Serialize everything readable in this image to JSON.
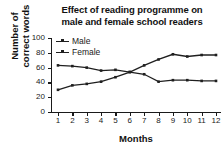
{
  "chart_data": {
    "type": "line",
    "title": "Effect of reading programme on male and female school readers",
    "title_lines": [
      "Effect of reading programme on",
      "male and female school readers"
    ],
    "xlabel": "Months",
    "ylabel": "Number of correct words",
    "ylabel_lines": [
      "Number of",
      "correct words"
    ],
    "x": [
      1,
      2,
      3,
      4,
      5,
      6,
      7,
      8,
      9,
      10,
      11,
      12
    ],
    "xtick_labels": [
      "1",
      "2",
      "3",
      "4",
      "5",
      "6",
      "7",
      "8",
      "9",
      "10",
      "11",
      "12"
    ],
    "ytick_labels": [
      "0",
      "20",
      "40",
      "60",
      "80",
      "100"
    ],
    "yticks": [
      0,
      20,
      40,
      60,
      80,
      100
    ],
    "ylim": [
      0,
      100
    ],
    "xlim": [
      1,
      12
    ],
    "grid": false,
    "legend_position": "top-left",
    "series": [
      {
        "name": "Male",
        "color": "#1f1f1f",
        "marker": "square",
        "values": [
          30,
          36,
          38,
          41,
          47,
          54,
          63,
          71,
          78,
          75,
          77,
          77
        ]
      },
      {
        "name": "Female",
        "color": "#1f1f1f",
        "marker": "square",
        "values": [
          63,
          62,
          60,
          56,
          57,
          54,
          51,
          41,
          43,
          43,
          42,
          42
        ]
      }
    ]
  },
  "legend": {
    "items": [
      {
        "label": "Male"
      },
      {
        "label": "Female"
      }
    ]
  },
  "colors": {
    "background": "#ffffff",
    "ink": "#1a1a1a",
    "series": "#1f1f1f"
  }
}
